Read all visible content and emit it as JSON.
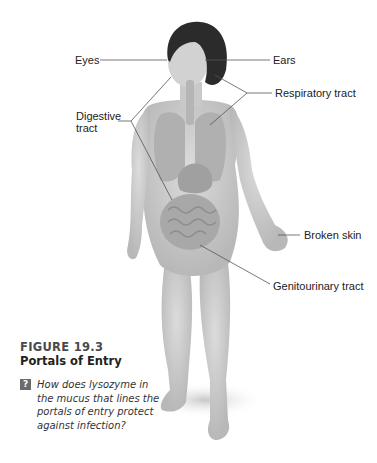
{
  "figure": {
    "number": "FIGURE 19.3",
    "title": "Portals of Entry",
    "question_icon": "question-mark-icon",
    "question": "How does lysozyme in the mucus that lines the portals of entry protect against infection?"
  },
  "labels": {
    "eyes": "Eyes",
    "ears": "Ears",
    "respiratory_tract": "Respiratory tract",
    "digestive_tract_line1": "Digestive",
    "digestive_tract_line2": "tract",
    "broken_skin": "Broken skin",
    "genitourinary_tract": "Genitourinary tract"
  },
  "colors": {
    "leader_line": "#555555",
    "skin": "#cfcfcf",
    "hair": "#2b2b2b",
    "organs": "#a9a9a9"
  }
}
